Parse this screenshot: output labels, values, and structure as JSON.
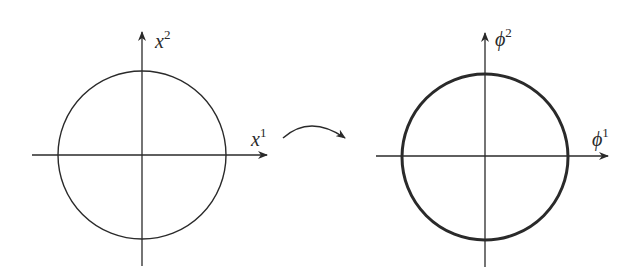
{
  "left_diagram": {
    "x_axis_label": "x",
    "x_axis_sup": "1",
    "y_axis_label": "x",
    "y_axis_sup": "2",
    "circle_stroke": "thin"
  },
  "right_diagram": {
    "x_axis_label": "ϕ",
    "x_axis_sup": "1",
    "y_axis_label": "ϕ",
    "y_axis_sup": "2",
    "circle_stroke": "thick"
  },
  "mapping_arrow": {
    "direction": "left-to-right",
    "shape": "curved-arrow"
  },
  "colors": {
    "ink": "#2a2a2a",
    "background": "#ffffff"
  }
}
